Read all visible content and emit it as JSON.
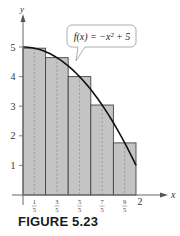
{
  "chart_data": {
    "type": "bar",
    "title": "",
    "function_label": "f(x) = −x² + 5",
    "xlabel": "x",
    "ylabel": "y",
    "xlim": [
      0,
      2
    ],
    "ylim": [
      0,
      5
    ],
    "y_ticks": [
      "1",
      "2",
      "3",
      "4",
      "5"
    ],
    "x_ticks": [
      {
        "num": "1",
        "den": "5"
      },
      {
        "num": "3",
        "den": "5"
      },
      {
        "num": "5",
        "den": "5"
      },
      {
        "num": "7",
        "den": "5"
      },
      {
        "num": "9",
        "den": "5"
      },
      {
        "label": "2"
      }
    ],
    "categories": [
      "1/5",
      "3/5",
      "5/5",
      "7/5",
      "9/5"
    ],
    "values": [
      4.96,
      4.64,
      4.0,
      3.04,
      1.76
    ],
    "rectangle_width": 0.4,
    "curve": {
      "expr": "-x^2+5",
      "from": 0,
      "to": 2
    },
    "grid": false,
    "colors": {
      "rect_fill": "#c4c4c4",
      "rect_stroke": "#444444",
      "curve": "#111111",
      "axis": "#555555"
    }
  },
  "caption": "FIGURE 5.23"
}
